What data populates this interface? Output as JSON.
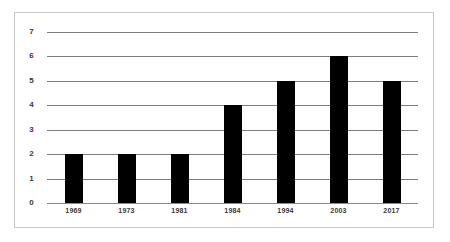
{
  "chart_data": {
    "type": "bar",
    "title": "",
    "subtitle": "",
    "xlabel": "",
    "ylabel": "",
    "categories": [
      "1969",
      "1973",
      "1981",
      "1984",
      "1994",
      "2003",
      "2017"
    ],
    "values": [
      2,
      2,
      2,
      4,
      5,
      6,
      5
    ],
    "series": [
      {
        "name": "",
        "values": [
          2,
          2,
          2,
          4,
          5,
          6,
          5
        ]
      }
    ],
    "ylim": [
      0,
      7
    ],
    "ytick_labels": [
      "0",
      "1",
      "2",
      "3",
      "4",
      "5",
      "6",
      "7"
    ],
    "ytick_values": [
      0,
      1,
      2,
      3,
      4,
      5,
      6,
      7
    ],
    "grid": "horizontal",
    "legend": "none",
    "bar_color": "#000000",
    "gridline_color": "#7d7d7d",
    "frame_color": "#c9c9c9",
    "background_color": "#ffffff",
    "tick_label_color": "#3a3a3a"
  }
}
